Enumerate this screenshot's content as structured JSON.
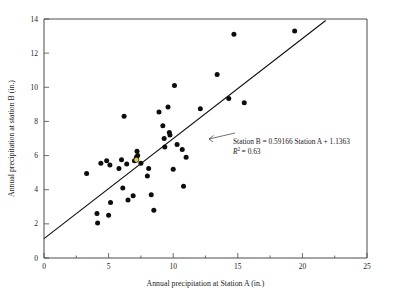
{
  "chart_data": {
    "type": "scatter",
    "title": "",
    "xlabel": "Annual precipitation at Station A (in.)",
    "ylabel": "Annual precipitation at station B (in.)",
    "xlim": [
      0,
      25
    ],
    "ylim": [
      0,
      14
    ],
    "xticks": [
      0,
      5,
      10,
      15,
      20,
      25
    ],
    "yticks": [
      0,
      2,
      4,
      6,
      8,
      10,
      12,
      14
    ],
    "xtick_labels": [
      "0",
      "5",
      "10",
      "15",
      "20",
      "25"
    ],
    "ytick_labels": [
      "0",
      "2",
      "4",
      "6",
      "8",
      "10",
      "12",
      "14"
    ],
    "grid": false,
    "legend": "none",
    "annotations": [
      "Station B = 0.59166 Station A + 1.1363",
      "R2 = 0.63"
    ],
    "annotation_lines": {
      "equation_prefix": "Station B = 0.59166 Station A + 1.1363",
      "r2_symbol": "R",
      "r2_exponent": "2",
      "r2_value": "= 0.63"
    },
    "fit": {
      "type": "linear",
      "slope": 0.59166,
      "intercept": 1.1363,
      "r_squared": 0.63,
      "x_start": 0,
      "x_end": 21.8
    },
    "points": [
      {
        "x": 3.3,
        "y": 4.95
      },
      {
        "x": 4.1,
        "y": 2.6
      },
      {
        "x": 4.15,
        "y": 2.05
      },
      {
        "x": 4.4,
        "y": 5.55
      },
      {
        "x": 4.85,
        "y": 5.7
      },
      {
        "x": 5.0,
        "y": 2.5
      },
      {
        "x": 5.1,
        "y": 5.45
      },
      {
        "x": 5.15,
        "y": 3.25
      },
      {
        "x": 5.8,
        "y": 5.25
      },
      {
        "x": 6.0,
        "y": 5.75
      },
      {
        "x": 6.1,
        "y": 4.1
      },
      {
        "x": 6.2,
        "y": 8.3
      },
      {
        "x": 6.4,
        "y": 5.5
      },
      {
        "x": 6.5,
        "y": 3.4
      },
      {
        "x": 6.9,
        "y": 3.65
      },
      {
        "x": 7.0,
        "y": 5.7
      },
      {
        "x": 7.15,
        "y": 5.9
      },
      {
        "x": 7.2,
        "y": 6.25
      },
      {
        "x": 7.25,
        "y": 6.0
      },
      {
        "x": 7.5,
        "y": 5.55
      },
      {
        "x": 8.0,
        "y": 4.8
      },
      {
        "x": 8.1,
        "y": 5.25
      },
      {
        "x": 8.3,
        "y": 3.7
      },
      {
        "x": 8.5,
        "y": 2.8
      },
      {
        "x": 8.9,
        "y": 8.55
      },
      {
        "x": 9.2,
        "y": 7.75
      },
      {
        "x": 9.3,
        "y": 7.0
      },
      {
        "x": 9.35,
        "y": 6.5
      },
      {
        "x": 9.6,
        "y": 8.85
      },
      {
        "x": 9.7,
        "y": 7.35
      },
      {
        "x": 9.75,
        "y": 7.2
      },
      {
        "x": 10.0,
        "y": 5.2
      },
      {
        "x": 10.1,
        "y": 10.1
      },
      {
        "x": 10.3,
        "y": 6.65
      },
      {
        "x": 10.7,
        "y": 6.35
      },
      {
        "x": 10.8,
        "y": 4.2
      },
      {
        "x": 11.0,
        "y": 5.9
      },
      {
        "x": 12.1,
        "y": 8.75
      },
      {
        "x": 13.4,
        "y": 10.75
      },
      {
        "x": 14.3,
        "y": 9.35
      },
      {
        "x": 14.7,
        "y": 13.1
      },
      {
        "x": 15.5,
        "y": 9.1
      },
      {
        "x": 19.4,
        "y": 13.3
      }
    ],
    "highlighted_points": [
      {
        "x": 7.15,
        "y": 5.75
      }
    ],
    "marker_color": "#0d0d0d",
    "highlight_color": "#d8d14a",
    "line_color": "#111111"
  }
}
